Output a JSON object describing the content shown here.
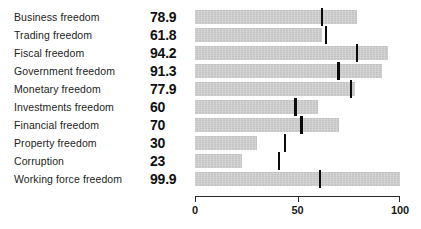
{
  "chart_data": {
    "type": "bar",
    "orientation": "horizontal",
    "title": "",
    "subtitle": "",
    "xlabel": "",
    "ylabel": "",
    "xlim": [
      0,
      100
    ],
    "grid": false,
    "legend": null,
    "axis": {
      "ticks": [
        0,
        50,
        100
      ],
      "tick_labels": [
        "0",
        "50",
        "100"
      ]
    },
    "categories": [
      "Business freedom",
      "Trading freedom",
      "Fiscal freedom",
      "Government freedom",
      "Monetary freedom",
      "Investments freedom",
      "Financial freedom",
      "Property freedom",
      "Corruption",
      "Working force freedom"
    ],
    "values": [
      78.9,
      61.8,
      94.2,
      91.3,
      77.9,
      60,
      70,
      30,
      23,
      99.9
    ],
    "value_labels": [
      "78.9",
      "61.8",
      "94.2",
      "91.3",
      "77.9",
      "60",
      "70",
      "30",
      "23",
      "99.9"
    ],
    "series": [
      {
        "name": "Score",
        "values": [
          78.9,
          61.8,
          94.2,
          91.3,
          77.9,
          60,
          70,
          30,
          23,
          99.9
        ]
      },
      {
        "name": "Reference marker",
        "type": "marker",
        "values": [
          62,
          64,
          79,
          70,
          76,
          49,
          52,
          44,
          41,
          61
        ]
      }
    ],
    "colors": {
      "bar": "#c9c9c9",
      "marker": "#0b0b0b",
      "axis": "#2b2b2b",
      "text": "#1a1a1a",
      "background": "#ffffff"
    }
  },
  "rows": [
    {
      "label": "Business freedom",
      "value_label": "78.9",
      "value": 78.9,
      "marker": 62
    },
    {
      "label": "Trading freedom",
      "value_label": "61.8",
      "value": 61.8,
      "marker": 64
    },
    {
      "label": "Fiscal freedom",
      "value_label": "94.2",
      "value": 94.2,
      "marker": 79
    },
    {
      "label": "Government freedom",
      "value_label": "91.3",
      "value": 91.3,
      "marker": 70
    },
    {
      "label": "Monetary freedom",
      "value_label": "77.9",
      "value": 77.9,
      "marker": 76
    },
    {
      "label": "Investments freedom",
      "value_label": "60",
      "value": 60,
      "marker": 49
    },
    {
      "label": "Financial freedom",
      "value_label": "70",
      "value": 70,
      "marker": 52
    },
    {
      "label": "Property freedom",
      "value_label": "30",
      "value": 30,
      "marker": 44
    },
    {
      "label": "Corruption",
      "value_label": "23",
      "value": 23,
      "marker": 41
    },
    {
      "label": "Working force freedom",
      "value_label": "99.9",
      "value": 99.9,
      "marker": 61
    }
  ],
  "axis_labels": [
    "0",
    "50",
    "100"
  ]
}
